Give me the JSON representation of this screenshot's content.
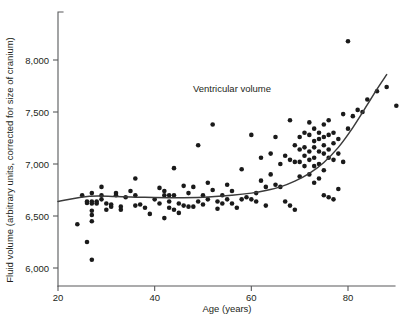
{
  "chart_data": {
    "type": "scatter",
    "title": "",
    "annotation": "Ventricular volume",
    "xlabel": "Age (years)",
    "ylabel": "Fluid volume (arbitrary units, corrected for size of cranium)",
    "xlim": [
      19,
      91
    ],
    "ylim": [
      5960,
      8290
    ],
    "xticks": [
      20,
      40,
      60,
      80
    ],
    "yticks": [
      6000,
      6500,
      7000,
      7500,
      8000
    ],
    "xtick_labels": [
      "20",
      "40",
      "60",
      "80"
    ],
    "ytick_labels": [
      "6,000",
      "6,500",
      "7,000",
      "7,500",
      "8,000"
    ],
    "grid": false,
    "legend": "none",
    "point_color": "#1a1a1a",
    "curve_color": "#3b3b3b",
    "axis_color": "#58595b",
    "series": [
      {
        "name": "Ventricular volume",
        "x": [
          24,
          25,
          26,
          26,
          26,
          27,
          27,
          27,
          27,
          27,
          27,
          27,
          28,
          28,
          29,
          29,
          29,
          30,
          30,
          31,
          31,
          32,
          32,
          33,
          33,
          34,
          35,
          36,
          36,
          36,
          37,
          38,
          39,
          40,
          41,
          41,
          42,
          42,
          42,
          43,
          43,
          43,
          44,
          44,
          44,
          45,
          45,
          46,
          46,
          47,
          47,
          48,
          48,
          49,
          49,
          50,
          50,
          51,
          51,
          52,
          52,
          53,
          53,
          54,
          54,
          55,
          55,
          56,
          56,
          57,
          58,
          58,
          59,
          60,
          60,
          61,
          61,
          62,
          62,
          63,
          63,
          64,
          64,
          65,
          65,
          66,
          66,
          67,
          67,
          68,
          68,
          68,
          69,
          69,
          69,
          70,
          70,
          70,
          70,
          71,
          71,
          71,
          71,
          72,
          72,
          72,
          72,
          72,
          73,
          73,
          73,
          73,
          73,
          73,
          74,
          74,
          74,
          74,
          74,
          75,
          75,
          75,
          75,
          75,
          75,
          76,
          76,
          76,
          76,
          76,
          77,
          77,
          77,
          77,
          78,
          78,
          78,
          79,
          79,
          80,
          80,
          81,
          82,
          83,
          84,
          86,
          88,
          90
        ],
        "y": [
          6420,
          6700,
          6640,
          6625,
          6250,
          6720,
          6640,
          6620,
          6550,
          6510,
          6450,
          6080,
          6640,
          6620,
          6700,
          6660,
          6780,
          6620,
          6560,
          6610,
          6590,
          6720,
          6700,
          6590,
          6560,
          6680,
          6740,
          6860,
          6700,
          6600,
          6610,
          6580,
          6520,
          6660,
          6770,
          6620,
          6740,
          6700,
          6480,
          6700,
          6640,
          6580,
          6960,
          6700,
          6560,
          6620,
          6530,
          6790,
          6600,
          6720,
          6590,
          6780,
          6590,
          7180,
          6640,
          6700,
          6610,
          6820,
          6660,
          7380,
          6750,
          6640,
          6570,
          6700,
          6620,
          6800,
          6660,
          6740,
          6620,
          6580,
          6950,
          6660,
          6680,
          7280,
          6660,
          6720,
          6640,
          7060,
          6840,
          6780,
          6600,
          7100,
          6900,
          7260,
          6800,
          7000,
          6780,
          7080,
          6640,
          7420,
          7040,
          6600,
          7180,
          7020,
          6560,
          7260,
          7140,
          7020,
          6880,
          7300,
          7160,
          7080,
          6980,
          7400,
          7280,
          7120,
          7040,
          6900,
          7340,
          7220,
          7160,
          7060,
          6980,
          6820,
          7300,
          7240,
          7120,
          7000,
          6860,
          7380,
          7260,
          7180,
          7100,
          6940,
          6700,
          7420,
          7280,
          7140,
          7060,
          6680,
          7300,
          7200,
          7040,
          6660,
          7240,
          7100,
          6760,
          7480,
          7020,
          8180,
          7340,
          7460,
          7520,
          7500,
          7620,
          7700,
          7740,
          7560
        ]
      }
    ],
    "trend_curve": {
      "name": "smoothed fit",
      "x": [
        20.0,
        26.5,
        32.0,
        38.0,
        44.0,
        50.0,
        56.0,
        60.0,
        63.0,
        66.0,
        69.0,
        72.0,
        75.0,
        78.0,
        81.0,
        84.0,
        86.0,
        88.0
      ],
      "y": [
        6640,
        6690,
        6688,
        6680,
        6676,
        6680,
        6700,
        6720,
        6745,
        6780,
        6835,
        6910,
        7015,
        7160,
        7350,
        7570,
        7720,
        7860
      ]
    }
  }
}
